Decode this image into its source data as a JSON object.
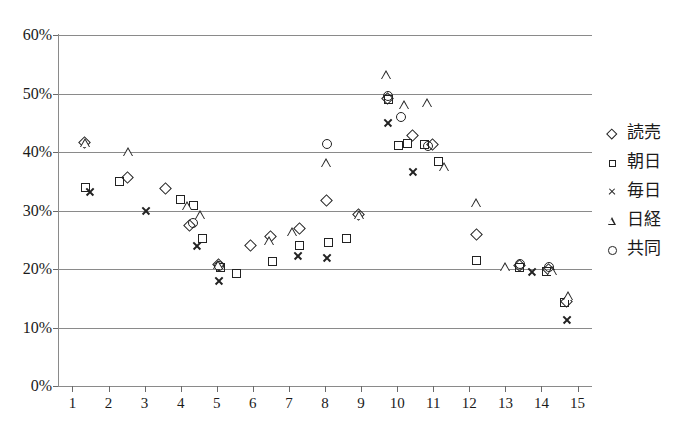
{
  "chart_data": {
    "type": "scatter",
    "title": "",
    "subtitle": "",
    "xlabel": "",
    "ylabel": "",
    "xlim": [
      0.6,
      15.4
    ],
    "ylim": [
      0,
      60
    ],
    "y_tick_labels": [
      "0%",
      "10%",
      "20%",
      "30%",
      "40%",
      "50%",
      "60%"
    ],
    "y_tick_values": [
      0,
      10,
      20,
      30,
      40,
      50,
      60
    ],
    "x_tick_labels": [
      "1",
      "2",
      "3",
      "4",
      "5",
      "6",
      "7",
      "8",
      "9",
      "10",
      "11",
      "12",
      "13",
      "14",
      "15"
    ],
    "x_tick_values": [
      1,
      2,
      3,
      4,
      5,
      6,
      7,
      8,
      9,
      10,
      11,
      12,
      13,
      14,
      15
    ],
    "grid": "horizontal",
    "legend_position": "right",
    "marker_color": "#222222",
    "gridline_color": "#8a8a8a",
    "series": [
      {
        "name": "読売",
        "marker": "diamond",
        "points": [
          {
            "x": 1.35,
            "y": 41.5
          },
          {
            "x": 2.55,
            "y": 35.6
          },
          {
            "x": 3.6,
            "y": 33.6
          },
          {
            "x": 4.25,
            "y": 27.3
          },
          {
            "x": 5.05,
            "y": 20.6
          },
          {
            "x": 5.95,
            "y": 24.0
          },
          {
            "x": 6.5,
            "y": 25.4
          },
          {
            "x": 7.3,
            "y": 26.8
          },
          {
            "x": 8.05,
            "y": 31.7
          },
          {
            "x": 8.95,
            "y": 29.2
          },
          {
            "x": 9.75,
            "y": 49.0
          },
          {
            "x": 10.45,
            "y": 42.7
          },
          {
            "x": 11.0,
            "y": 41.2
          },
          {
            "x": 12.2,
            "y": 25.8
          },
          {
            "x": 13.4,
            "y": 20.5
          },
          {
            "x": 14.2,
            "y": 19.9
          },
          {
            "x": 14.7,
            "y": 14.3
          }
        ]
      },
      {
        "name": "朝日",
        "marker": "square",
        "points": [
          {
            "x": 1.35,
            "y": 33.9
          },
          {
            "x": 2.3,
            "y": 35.0
          },
          {
            "x": 4.0,
            "y": 31.8
          },
          {
            "x": 4.35,
            "y": 30.9
          },
          {
            "x": 4.6,
            "y": 25.2
          },
          {
            "x": 5.1,
            "y": 20.3
          },
          {
            "x": 5.55,
            "y": 19.2
          },
          {
            "x": 6.55,
            "y": 21.3
          },
          {
            "x": 7.3,
            "y": 24.1
          },
          {
            "x": 8.1,
            "y": 24.5
          },
          {
            "x": 8.6,
            "y": 25.2
          },
          {
            "x": 9.75,
            "y": 49.0
          },
          {
            "x": 10.05,
            "y": 41.1
          },
          {
            "x": 10.3,
            "y": 41.4
          },
          {
            "x": 10.75,
            "y": 41.2
          },
          {
            "x": 11.15,
            "y": 38.4
          },
          {
            "x": 12.2,
            "y": 21.5
          },
          {
            "x": 13.4,
            "y": 20.2
          },
          {
            "x": 14.15,
            "y": 19.6
          },
          {
            "x": 14.65,
            "y": 14.2
          }
        ]
      },
      {
        "name": "毎日",
        "marker": "cross",
        "points": [
          {
            "x": 1.5,
            "y": 33.2
          },
          {
            "x": 3.05,
            "y": 30.0
          },
          {
            "x": 4.45,
            "y": 23.9
          },
          {
            "x": 5.05,
            "y": 17.9
          },
          {
            "x": 7.25,
            "y": 22.3
          },
          {
            "x": 8.05,
            "y": 21.9
          },
          {
            "x": 9.75,
            "y": 45.0
          },
          {
            "x": 10.45,
            "y": 36.6
          },
          {
            "x": 13.75,
            "y": 19.5
          },
          {
            "x": 14.7,
            "y": 11.3
          }
        ]
      },
      {
        "name": "日経",
        "marker": "triangle",
        "points": [
          {
            "x": 1.35,
            "y": 41.5
          },
          {
            "x": 2.55,
            "y": 40.0
          },
          {
            "x": 4.2,
            "y": 30.7
          },
          {
            "x": 4.55,
            "y": 29.3
          },
          {
            "x": 5.05,
            "y": 20.6
          },
          {
            "x": 6.45,
            "y": 24.8
          },
          {
            "x": 7.1,
            "y": 26.4
          },
          {
            "x": 8.05,
            "y": 38.1
          },
          {
            "x": 8.95,
            "y": 29.2
          },
          {
            "x": 9.7,
            "y": 53.2
          },
          {
            "x": 10.2,
            "y": 48.1
          },
          {
            "x": 10.85,
            "y": 48.3
          },
          {
            "x": 11.3,
            "y": 37.4
          },
          {
            "x": 12.2,
            "y": 31.2
          },
          {
            "x": 13.0,
            "y": 20.4
          },
          {
            "x": 14.3,
            "y": 19.7
          },
          {
            "x": 14.75,
            "y": 15.3
          }
        ]
      },
      {
        "name": "共同",
        "marker": "circle",
        "points": [
          {
            "x": 4.35,
            "y": 27.9
          },
          {
            "x": 5.05,
            "y": 20.5
          },
          {
            "x": 8.05,
            "y": 41.4
          },
          {
            "x": 9.75,
            "y": 49.6
          },
          {
            "x": 10.1,
            "y": 45.9
          },
          {
            "x": 10.85,
            "y": 41.0
          },
          {
            "x": 13.4,
            "y": 20.9
          },
          {
            "x": 14.2,
            "y": 20.4
          }
        ]
      }
    ]
  },
  "legend": {
    "items": [
      {
        "label": "読売",
        "marker": "diamond"
      },
      {
        "label": "朝日",
        "marker": "square"
      },
      {
        "label": "毎日",
        "marker": "cross"
      },
      {
        "label": "日経",
        "marker": "triangle"
      },
      {
        "label": "共同",
        "marker": "circle"
      }
    ]
  },
  "caption": {
    "text": ""
  }
}
